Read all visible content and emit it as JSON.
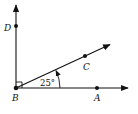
{
  "diagram": {
    "type": "geometry-angle",
    "vertex": {
      "label": "B",
      "x": 16,
      "y": 88
    },
    "points": [
      {
        "label": "D",
        "x": 16,
        "y": 26,
        "label_x": 5,
        "label_y": 31
      },
      {
        "label": "C",
        "x": 85,
        "y": 56,
        "label_x": 83,
        "label_y": 69
      },
      {
        "label": "A",
        "x": 97,
        "y": 88,
        "label_x": 94,
        "label_y": 101
      }
    ],
    "rays": [
      {
        "name": "BD",
        "to_x": 16,
        "to_y": 4
      },
      {
        "name": "BC",
        "to_x": 111,
        "to_y": 44
      },
      {
        "name": "BA",
        "to_x": 129,
        "to_y": 88
      }
    ],
    "angle_label": "25°",
    "right_angle_marker": true,
    "colors": {
      "stroke": "#111111",
      "background": "#ffffff"
    }
  },
  "labels": {
    "D": "D",
    "C": "C",
    "A": "A",
    "B": "B",
    "angle": "25°"
  }
}
